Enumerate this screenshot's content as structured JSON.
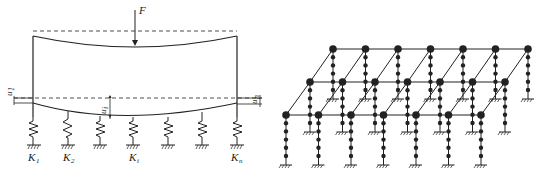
{
  "left_diagram": {
    "force_label": "F",
    "displacement_labels": {
      "left": "u",
      "left_sub": "1",
      "mid": "u",
      "mid_sub": "i",
      "right": "u",
      "right_sub": "n"
    },
    "spring_labels": [
      {
        "main": "K",
        "sub": "1"
      },
      {
        "main": "K",
        "sub": "2"
      },
      {
        "main": "K",
        "sub": "i"
      },
      {
        "main": "K",
        "sub": "n"
      }
    ],
    "spring_count": 7
  },
  "right_diagram": {
    "rows": 3,
    "columns_per_row": 7,
    "intermediate_nodes_per_column": 5
  },
  "colors": {
    "line": "#222222",
    "background": "#ffffff"
  }
}
